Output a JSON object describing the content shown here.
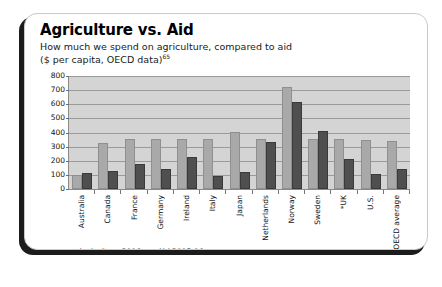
{
  "card": {
    "title": "Agriculture vs. Aid",
    "subtitle_line1": "How much we spend on agriculture, compared to aid",
    "subtitle_line2": "($ per capita, OECD data)",
    "subtitle_footnote": "65"
  },
  "colors": {
    "agriculture": "#a9a9a9",
    "aid": "#4f4f4f",
    "plot_background": "#d4d4d4",
    "gridline": "#9a9a9a",
    "card_background": "#ffffff",
    "shadow": "#1c1c1c"
  },
  "chart_data": {
    "type": "bar",
    "title": "Agriculture vs. Aid",
    "subtitle": "How much we spend on agriculture, compared to aid ($ per capita, OECD data)",
    "xlabel": "",
    "ylabel": "",
    "ylim": [
      0,
      800
    ],
    "yticks": [
      800,
      700,
      600,
      500,
      400,
      300,
      200,
      100,
      0
    ],
    "grid": true,
    "legend_position": "bottom-left",
    "categories": [
      "Australia",
      "Canada",
      "France",
      "Germany",
      "Ireland",
      "Italy",
      "Japan",
      "Netherlands",
      "Norway",
      "Sweden",
      "*UK",
      "U.S.",
      "OECD average"
    ],
    "series": [
      {
        "name": "Agriculture 2006",
        "color": "#a9a9a9",
        "values": [
          85,
          315,
          340,
          340,
          340,
          340,
          390,
          340,
          705,
          340,
          340,
          335,
          325
        ]
      },
      {
        "name": "Aid 2005-06",
        "color": "#4f4f4f",
        "values": [
          100,
          115,
          165,
          130,
          210,
          80,
          105,
          320,
          605,
          400,
          195,
          95,
          125
        ]
      }
    ]
  }
}
